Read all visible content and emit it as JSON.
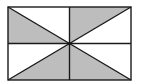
{
  "diagram": {
    "type": "geometry-figure",
    "colors": {
      "background": "#ffffff",
      "shade": "#bdbdbd",
      "stroke": "#1a1a1a"
    },
    "rect": {
      "x": 8,
      "y": 7,
      "w": 123,
      "h": 73
    },
    "shaded_regions": [
      "top-left cell, left triangle",
      "top-right cell, top triangle",
      "bottom-left cell, bottom triangle",
      "bottom-right cell, bottom triangle"
    ]
  }
}
